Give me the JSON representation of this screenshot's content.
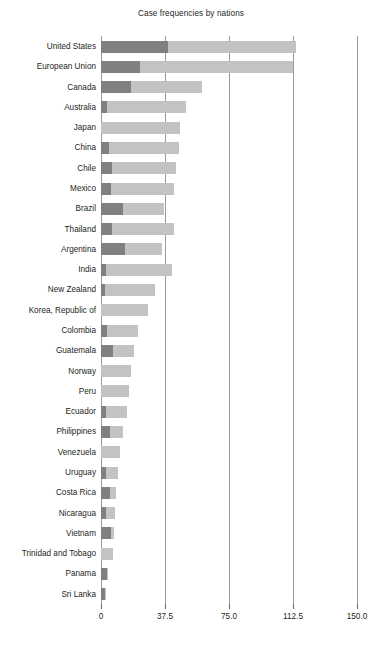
{
  "chart_data": {
    "type": "bar",
    "orientation": "horizontal",
    "stacked": true,
    "title": "Case frequencies by nations",
    "xlabel": "",
    "ylabel": "",
    "xlim": [
      0,
      150
    ],
    "ylim": null,
    "grid": true,
    "legend": null,
    "xticks": [
      "0",
      "37.5",
      "75.0",
      "112.5",
      "150.0"
    ],
    "xtick_values": [
      0,
      37.5,
      75,
      112.5,
      150
    ],
    "categories": [
      "United States",
      "European Union",
      "Canada",
      "Australia",
      "Japan",
      "China",
      "Chile",
      "Mexico",
      "Brazil",
      "Thailand",
      "Argentina",
      "India",
      "New Zealand",
      "Korea, Republic of",
      "Colombia",
      "Guatemala",
      "Norway",
      "Peru",
      "Ecuador",
      "Philippines",
      "Venezuela",
      "Uruguay",
      "Costa Rica",
      "Nicaragua",
      "Vietnam",
      "Trinidad and Tobago",
      "Panama",
      "Sri Lanka"
    ],
    "series": [
      {
        "name": "dark-segment",
        "color": "#808080",
        "values": [
          39,
          23,
          17.5,
          3.5,
          0,
          4.5,
          6.5,
          6,
          13,
          6.5,
          14,
          3,
          2.5,
          0,
          3.5,
          7,
          0,
          0,
          3,
          5,
          0,
          3,
          5,
          3,
          6,
          0,
          3.5,
          2.5
        ]
      },
      {
        "name": "light-segment",
        "color": "#c3c3c3",
        "values": [
          75.5,
          89.5,
          41.5,
          46.5,
          46,
          41.5,
          37.5,
          37,
          24,
          36,
          22,
          38.5,
          29,
          27.5,
          18,
          12.5,
          17.5,
          16.5,
          12,
          8,
          11,
          7,
          3.5,
          5.5,
          1.5,
          7,
          0.5,
          0.5
        ]
      }
    ],
    "totals": [
      114.5,
      112.5,
      59,
      50,
      46,
      46,
      44,
      43,
      37,
      42.5,
      36,
      41.5,
      31.5,
      27.5,
      21.5,
      19.5,
      17.5,
      16.5,
      15,
      13,
      11,
      10,
      8.5,
      8.5,
      7.5,
      7,
      4,
      3
    ]
  }
}
